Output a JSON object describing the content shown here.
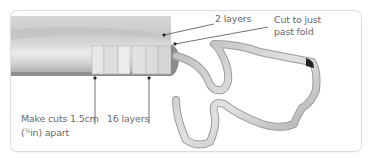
{
  "diagram": {
    "annotations": [
      {
        "id": "two-layers",
        "text": "2 layers"
      },
      {
        "id": "cut-past-fold",
        "line1": "Cut to just",
        "line2": "past fold"
      },
      {
        "id": "cut-spacing",
        "line1": "Make cuts 1.5cm",
        "line2_prefix": "(",
        "fraction": "⅝",
        "line2_suffix": "in) apart"
      },
      {
        "id": "sixteen-layers",
        "text": "16 layers"
      }
    ],
    "colors": {
      "card_border": "#dcdcdc",
      "fabric_light": "#d8d8d8",
      "fabric_dark": "#9a9a9a",
      "leader_line": "#333333",
      "label_text": "#6a6a6a"
    }
  }
}
